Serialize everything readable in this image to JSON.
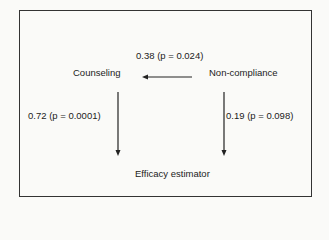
{
  "diagram": {
    "type": "path-diagram",
    "nodes": [
      {
        "id": "counseling",
        "label": "Counseling"
      },
      {
        "id": "non_compliance",
        "label": "Non-compliance"
      },
      {
        "id": "efficacy_estimator",
        "label": "Efficacy estimator"
      }
    ],
    "edges": [
      {
        "from": "non_compliance",
        "to": "counseling",
        "label": "0.38 (p = 0.024)"
      },
      {
        "from": "counseling",
        "to": "efficacy_estimator",
        "label": "0.72 (p = 0.0001)"
      },
      {
        "from": "non_compliance",
        "to": "efficacy_estimator",
        "label": "0.19 (p = 0.098)"
      }
    ]
  },
  "colors": {
    "line": "#222222",
    "text": "#222222",
    "background": "#fafaf8"
  }
}
